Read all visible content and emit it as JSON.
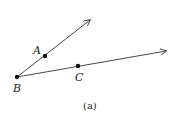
{
  "figure": {
    "caption": "(a)",
    "points": [
      {
        "name": "A",
        "x": 45,
        "y": 56
      },
      {
        "name": "B",
        "x": 17,
        "y": 77
      },
      {
        "name": "C",
        "x": 78,
        "y": 66
      }
    ],
    "rays": [
      {
        "name": "ray-BA",
        "from": "B",
        "to": {
          "x": 90,
          "y": 20
        }
      },
      {
        "name": "ray-BC",
        "from": "B",
        "to": {
          "x": 166,
          "y": 51
        }
      }
    ],
    "labels": {
      "A": "A",
      "B": "B",
      "C": "C"
    },
    "stroke_color": "#333333"
  }
}
